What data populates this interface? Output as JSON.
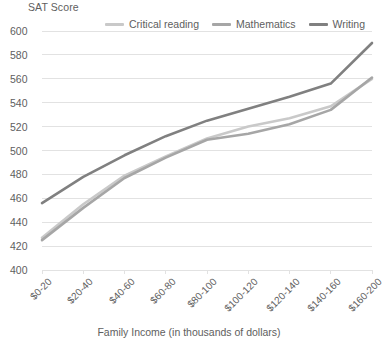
{
  "chart_data": {
    "type": "line",
    "title": "SAT Score",
    "xlabel": "Family Income (in thousands of dollars)",
    "ylabel": "SAT Score",
    "ylim": [
      400,
      600
    ],
    "ytick_step": 20,
    "yticks": [
      600,
      580,
      560,
      540,
      520,
      500,
      480,
      460,
      440,
      420,
      400
    ],
    "grid": true,
    "grid_axis": "y",
    "legend_position": "top",
    "categories": [
      "$0-20",
      "$20-40",
      "$40-60",
      "$60-80",
      "$80-100",
      "$100-120",
      "$120-140",
      "$140-160",
      "$160-200"
    ],
    "series": [
      {
        "name": "Critical reading",
        "color": "#c9c9c9",
        "values": [
          427,
          455,
          479,
          495,
          510,
          520,
          527,
          537,
          560
        ]
      },
      {
        "name": "Mathematics",
        "color": "#a6a6a6",
        "values": [
          425,
          452,
          477,
          494,
          509,
          514,
          522,
          534,
          561
        ]
      },
      {
        "name": "Writing",
        "color": "#808080",
        "values": [
          456,
          478,
          496,
          512,
          525,
          535,
          545,
          556,
          590
        ]
      }
    ]
  },
  "axes": {
    "y_title": "SAT Score",
    "x_title": "Family Income (in thousands of dollars)"
  },
  "style": {
    "grid_color": "#e2e2e2",
    "text_color": "#5e5e5e",
    "background": "#ffffff"
  }
}
